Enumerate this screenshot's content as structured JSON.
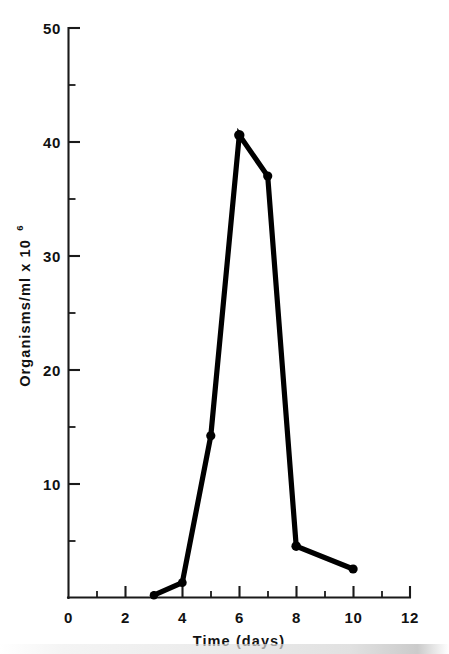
{
  "chart_data": {
    "type": "line",
    "title": "",
    "xlabel": "Time (days)",
    "ylabel": "Organisms/ml x 10",
    "ylabel_exponent": "6",
    "x": [
      3,
      4,
      5,
      6,
      7,
      8,
      10
    ],
    "values": [
      0.2,
      1.3,
      14.2,
      40.6,
      37.0,
      4.5,
      2.5
    ],
    "series": [
      {
        "name": "Organisms/ml x 10^6",
        "x": [
          3,
          4,
          5,
          6,
          7,
          8,
          10
        ],
        "values": [
          0.2,
          1.3,
          14.2,
          40.6,
          37.0,
          4.5,
          2.5
        ]
      }
    ],
    "xlim": [
      0,
      12
    ],
    "ylim": [
      0,
      50
    ],
    "x_major_ticks": [
      0,
      2,
      4,
      6,
      8,
      10,
      12
    ],
    "x_minor_ticks": [
      1,
      3,
      5,
      7,
      9,
      11
    ],
    "y_major_ticks": [
      0,
      10,
      20,
      30,
      40,
      50
    ],
    "y_minor_ticks": [
      5,
      15,
      25,
      35,
      45
    ],
    "x_tick_labels": [
      "0",
      "2",
      "4",
      "6",
      "8",
      "10",
      "12"
    ],
    "y_tick_labels": [
      "0",
      "10",
      "20",
      "30",
      "40",
      "50"
    ],
    "grid": false,
    "legend": false,
    "legend_position": "none",
    "marker": "filled-circle",
    "line_color": "#000000",
    "marker_color": "#000000",
    "axis_color": "#1a1a1a",
    "background_color": "#ffffff"
  }
}
